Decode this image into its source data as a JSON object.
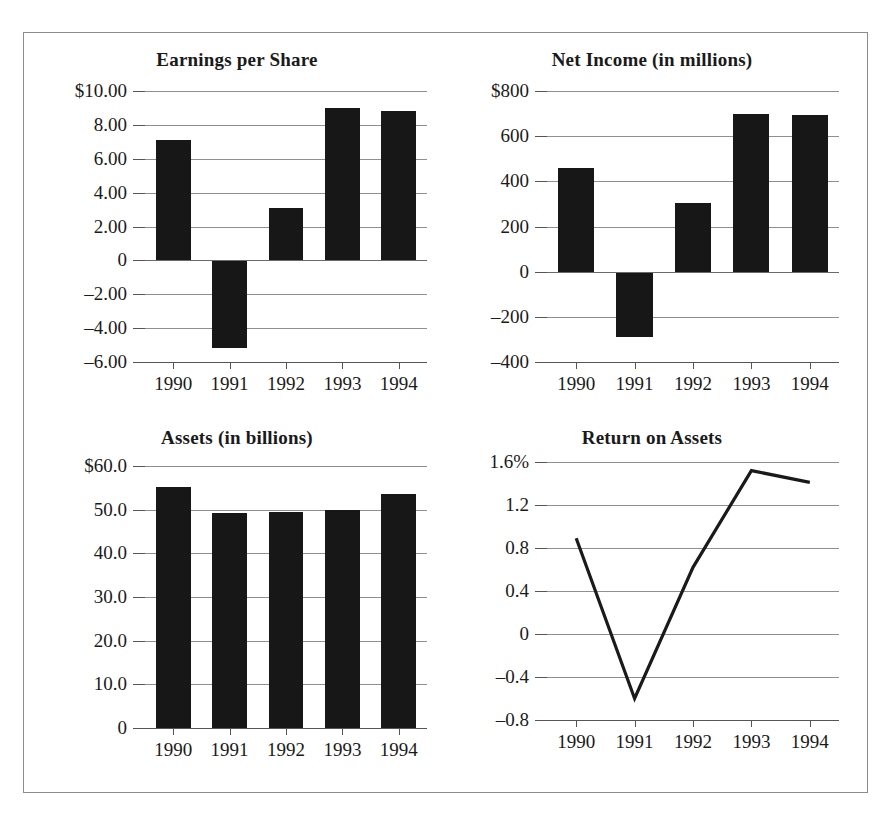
{
  "figure": {
    "panels": [
      "Earnings per Share",
      "Net Income (in millions)",
      "Assets (in billions)",
      "Return on Assets"
    ]
  },
  "chart_data": [
    {
      "type": "bar",
      "title": "Earnings per Share",
      "categories": [
        "1990",
        "1991",
        "1992",
        "1993",
        "1994"
      ],
      "values": [
        7.1,
        -5.2,
        3.1,
        9.0,
        8.8
      ],
      "ytick_labels": [
        "$10.00",
        "8.00",
        "6.00",
        "4.00",
        "2.00",
        "0",
        "-2.00",
        "-4.00",
        "-6.00"
      ],
      "ytick_values": [
        10,
        8,
        6,
        4,
        2,
        0,
        -2,
        -4,
        -6
      ],
      "ylim": [
        -6,
        10
      ],
      "xlabel": "",
      "ylabel": "",
      "grid": true,
      "legend": "none"
    },
    {
      "type": "bar",
      "title": "Net Income (in millions)",
      "categories": [
        "1990",
        "1991",
        "1992",
        "1993",
        "1994"
      ],
      "values": [
        460,
        -290,
        305,
        700,
        695
      ],
      "ytick_labels": [
        "$800",
        "600",
        "400",
        "200",
        "0",
        "-200",
        "-400"
      ],
      "ytick_values": [
        800,
        600,
        400,
        200,
        0,
        -200,
        -400
      ],
      "ylim": [
        -400,
        800
      ],
      "xlabel": "",
      "ylabel": "",
      "grid": true,
      "legend": "none"
    },
    {
      "type": "bar",
      "title": "Assets (in billions)",
      "categories": [
        "1990",
        "1991",
        "1992",
        "1993",
        "1994"
      ],
      "values": [
        55.3,
        49.3,
        49.4,
        50.0,
        53.5
      ],
      "ytick_labels": [
        "$60.0",
        "50.0",
        "40.0",
        "30.0",
        "20.0",
        "10.0",
        "0"
      ],
      "ytick_values": [
        60,
        50,
        40,
        30,
        20,
        10,
        0
      ],
      "ylim": [
        0,
        60
      ],
      "xlabel": "",
      "ylabel": "",
      "grid": true,
      "legend": "none"
    },
    {
      "type": "line",
      "title": "Return on Assets",
      "categories": [
        "1990",
        "1991",
        "1992",
        "1993",
        "1994"
      ],
      "values": [
        0.89,
        -0.6,
        0.62,
        1.52,
        1.41
      ],
      "ytick_labels": [
        "1.6%",
        "1.2",
        "0.8",
        "0.4",
        "0",
        "-0.4",
        "-0.8"
      ],
      "ytick_values": [
        1.6,
        1.2,
        0.8,
        0.4,
        0,
        -0.4,
        -0.8
      ],
      "ylim": [
        -0.8,
        1.6
      ],
      "xlabel": "",
      "ylabel": "",
      "grid": true,
      "legend": "none"
    }
  ],
  "style": {
    "bar_color": "#171717",
    "line_color": "#1a1a1a",
    "grid_color": "#8f8f8f",
    "frame_color": "#8c8c8c",
    "text_color": "#1a1a1a"
  }
}
